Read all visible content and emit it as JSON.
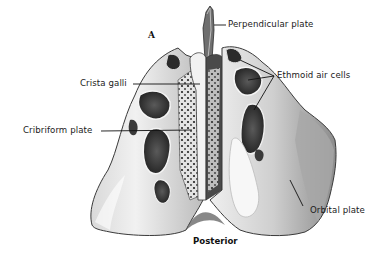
{
  "figure": {
    "panel_letter": "A",
    "orientation_caption": "Posterior"
  },
  "labels": {
    "perpendicular_plate": "Perpendicular plate",
    "crista_galli": "Crista galli",
    "cribriform_plate": "Cribriform plate",
    "ethmoid_air_cells": "Ethmoid air cells",
    "orbital_plate": "Orbital plate"
  },
  "colors": {
    "background": "#ffffff",
    "label_text": "#1a1a1a",
    "leader_line": "#111111",
    "bone_light": "#e9e9e9",
    "bone_mid": "#9a9a9a",
    "bone_dark": "#3a3a3a",
    "cavity": "#2a2a2a"
  }
}
